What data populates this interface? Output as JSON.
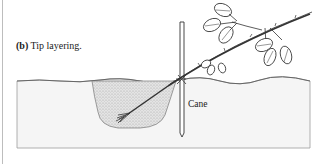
{
  "figure": {
    "caption_tag": "(b)",
    "caption_text": " Tip layering.",
    "labels": {
      "cane": "Cane"
    }
  },
  "colors": {
    "ink": "#333333",
    "soil_fill": "#f4f4f4",
    "soil_edge": "#9a9a9a",
    "mound_fill": "#dcdcdc",
    "border": "#bdbdbd"
  }
}
